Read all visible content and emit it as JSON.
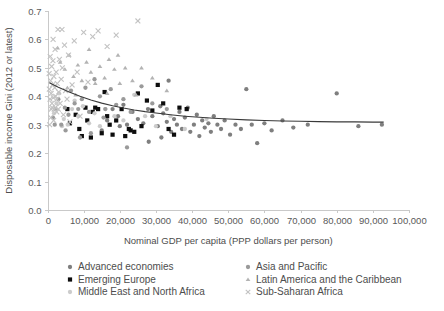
{
  "chart_data": {
    "type": "scatter",
    "title": "",
    "xlabel": "Nominal GDP per capita (PPP dollars per person)",
    "ylabel": "Disposable income Gini (2012 or latest)",
    "xlim": [
      0,
      100000
    ],
    "ylim": [
      0.0,
      0.7
    ],
    "xticks": [
      0,
      10000,
      20000,
      30000,
      40000,
      50000,
      60000,
      70000,
      80000,
      90000,
      100000
    ],
    "xtick_labels": [
      "0",
      "10,000",
      "20,000",
      "30,000",
      "40,000",
      "50,000",
      "60,000",
      "70,000",
      "80,000",
      "90,000",
      "100,000"
    ],
    "yticks": [
      0.0,
      0.1,
      0.2,
      0.3,
      0.4,
      0.5,
      0.6,
      0.7
    ],
    "ytick_labels": [
      "0.0",
      "0.1",
      "0.2",
      "0.3",
      "0.4",
      "0.5",
      "0.6",
      "0.7"
    ],
    "grid": false,
    "legend_position": "bottom",
    "series": [
      {
        "name": "Advanced economies",
        "marker": "circle",
        "color": "#7f7f7f",
        "size": 3.1,
        "points": [
          [
            23500,
            0.345
          ],
          [
            25000,
            0.32
          ],
          [
            26500,
            0.305
          ],
          [
            27800,
            0.355
          ],
          [
            29000,
            0.33
          ],
          [
            30500,
            0.295
          ],
          [
            31200,
            0.365
          ],
          [
            32000,
            0.34
          ],
          [
            33000,
            0.31
          ],
          [
            34200,
            0.275
          ],
          [
            35000,
            0.32
          ],
          [
            35800,
            0.3
          ],
          [
            36500,
            0.345
          ],
          [
            37200,
            0.285
          ],
          [
            38000,
            0.325
          ],
          [
            38800,
            0.36
          ],
          [
            39500,
            0.275
          ],
          [
            40500,
            0.3
          ],
          [
            41300,
            0.335
          ],
          [
            42000,
            0.26
          ],
          [
            42800,
            0.315
          ],
          [
            43500,
            0.29
          ],
          [
            44500,
            0.305
          ],
          [
            45200,
            0.275
          ],
          [
            46000,
            0.33
          ],
          [
            47000,
            0.3
          ],
          [
            48000,
            0.285
          ],
          [
            49000,
            0.315
          ],
          [
            50500,
            0.265
          ],
          [
            52000,
            0.3
          ],
          [
            53500,
            0.285
          ],
          [
            55000,
            0.425
          ],
          [
            56500,
            0.3
          ],
          [
            58000,
            0.235
          ],
          [
            60000,
            0.305
          ],
          [
            62000,
            0.28
          ],
          [
            65000,
            0.315
          ],
          [
            68000,
            0.29
          ],
          [
            72000,
            0.3
          ],
          [
            80000,
            0.41
          ],
          [
            86000,
            0.295
          ],
          [
            92500,
            0.3
          ],
          [
            21000,
            0.37
          ],
          [
            22000,
            0.3
          ],
          [
            19500,
            0.33
          ],
          [
            18000,
            0.355
          ],
          [
            16500,
            0.315
          ],
          [
            15000,
            0.28
          ],
          [
            28000,
            0.24
          ],
          [
            31500,
            0.255
          ],
          [
            33500,
            0.455
          ],
          [
            20000,
            0.295
          ]
        ]
      },
      {
        "name": "Emerging Europe",
        "marker": "square",
        "color": "#0d0d0d",
        "size": 4.2,
        "points": [
          [
            5500,
            0.355
          ],
          [
            6200,
            0.305
          ],
          [
            7800,
            0.335
          ],
          [
            8800,
            0.285
          ],
          [
            9500,
            0.26
          ],
          [
            11000,
            0.315
          ],
          [
            12500,
            0.345
          ],
          [
            13200,
            0.36
          ],
          [
            14000,
            0.355
          ],
          [
            15000,
            0.27
          ],
          [
            15800,
            0.415
          ],
          [
            16500,
            0.33
          ],
          [
            17200,
            0.3
          ],
          [
            18000,
            0.265
          ],
          [
            19000,
            0.315
          ],
          [
            20500,
            0.355
          ],
          [
            21500,
            0.26
          ],
          [
            22500,
            0.285
          ],
          [
            23000,
            0.28
          ],
          [
            24000,
            0.275
          ],
          [
            25000,
            0.41
          ],
          [
            26000,
            0.295
          ],
          [
            27500,
            0.385
          ],
          [
            29000,
            0.35
          ],
          [
            30500,
            0.44
          ],
          [
            32000,
            0.375
          ],
          [
            33500,
            0.285
          ],
          [
            35000,
            0.265
          ],
          [
            36500,
            0.36
          ],
          [
            38500,
            0.355
          ],
          [
            10500,
            0.36
          ],
          [
            12000,
            0.255
          ]
        ]
      },
      {
        "name": "Middle East and North Africa",
        "marker": "circle",
        "color": "#cccccc",
        "size": 3.1,
        "points": [
          [
            1800,
            0.34
          ],
          [
            3200,
            0.41
          ],
          [
            4500,
            0.32
          ],
          [
            5600,
            0.3
          ],
          [
            6800,
            0.355
          ],
          [
            7500,
            0.385
          ],
          [
            8500,
            0.33
          ],
          [
            9800,
            0.365
          ],
          [
            11500,
            0.305
          ],
          [
            13000,
            0.34
          ],
          [
            14500,
            0.295
          ],
          [
            16000,
            0.355
          ],
          [
            18500,
            0.33
          ],
          [
            21000,
            0.315
          ],
          [
            24000,
            0.405
          ],
          [
            27000,
            0.33
          ],
          [
            30000,
            0.295
          ],
          [
            34000,
            0.33
          ],
          [
            38000,
            0.285
          ],
          [
            44000,
            0.32
          ],
          [
            2500,
            0.375
          ],
          [
            4000,
            0.295
          ]
        ]
      },
      {
        "name": "Asia and Pacific",
        "marker": "circle",
        "color": "#9a9a9a",
        "size": 3.1,
        "points": [
          [
            1500,
            0.325
          ],
          [
            2200,
            0.355
          ],
          [
            3000,
            0.39
          ],
          [
            3800,
            0.3
          ],
          [
            4800,
            0.36
          ],
          [
            5800,
            0.335
          ],
          [
            6500,
            0.42
          ],
          [
            7500,
            0.375
          ],
          [
            8500,
            0.355
          ],
          [
            9500,
            0.39
          ],
          [
            10500,
            0.43
          ],
          [
            11500,
            0.345
          ],
          [
            13000,
            0.46
          ],
          [
            14500,
            0.4
          ],
          [
            16000,
            0.355
          ],
          [
            17500,
            0.425
          ],
          [
            19000,
            0.37
          ],
          [
            21000,
            0.39
          ],
          [
            23000,
            0.345
          ],
          [
            26000,
            0.435
          ],
          [
            29000,
            0.375
          ],
          [
            33000,
            0.355
          ],
          [
            2000,
            0.3
          ],
          [
            5000,
            0.28
          ],
          [
            9000,
            0.255
          ],
          [
            12000,
            0.27
          ],
          [
            15500,
            0.325
          ],
          [
            22000,
            0.22
          ]
        ]
      },
      {
        "name": "Latin America and the Caribbean",
        "marker": "triangle",
        "color": "#b3b3b3",
        "size": 3.6,
        "points": [
          [
            3500,
            0.52
          ],
          [
            4800,
            0.495
          ],
          [
            6000,
            0.545
          ],
          [
            7200,
            0.47
          ],
          [
            8400,
            0.51
          ],
          [
            9500,
            0.455
          ],
          [
            10800,
            0.52
          ],
          [
            12000,
            0.485
          ],
          [
            13200,
            0.445
          ],
          [
            14500,
            0.505
          ],
          [
            15800,
            0.465
          ],
          [
            17000,
            0.53
          ],
          [
            18500,
            0.495
          ],
          [
            20000,
            0.445
          ],
          [
            21500,
            0.5
          ],
          [
            23500,
            0.455
          ],
          [
            26000,
            0.5
          ],
          [
            29000,
            0.465
          ],
          [
            33000,
            0.42
          ],
          [
            2800,
            0.57
          ],
          [
            11500,
            0.565
          ],
          [
            16500,
            0.41
          ],
          [
            19500,
            0.545
          ],
          [
            5500,
            0.43
          ],
          [
            7800,
            0.405
          ],
          [
            24500,
            0.405
          ]
        ]
      },
      {
        "name": "Sub-Saharan Africa",
        "marker": "x",
        "color": "#c2c2c2",
        "size": 3.4,
        "points": [
          [
            500,
            0.425
          ],
          [
            700,
            0.39
          ],
          [
            850,
            0.455
          ],
          [
            1000,
            0.41
          ],
          [
            1150,
            0.505
          ],
          [
            1250,
            0.375
          ],
          [
            1400,
            0.44
          ],
          [
            1500,
            0.525
          ],
          [
            1600,
            0.395
          ],
          [
            1750,
            0.47
          ],
          [
            1850,
            0.355
          ],
          [
            2000,
            0.43
          ],
          [
            2100,
            0.565
          ],
          [
            2250,
            0.4
          ],
          [
            2400,
            0.485
          ],
          [
            2550,
            0.345
          ],
          [
            2700,
            0.445
          ],
          [
            2900,
            0.635
          ],
          [
            3100,
            0.415
          ],
          [
            3300,
            0.53
          ],
          [
            3500,
            0.375
          ],
          [
            3800,
            0.46
          ],
          [
            4100,
            0.5
          ],
          [
            4400,
            0.335
          ],
          [
            4700,
            0.58
          ],
          [
            5000,
            0.42
          ],
          [
            5400,
            0.39
          ],
          [
            5800,
            0.545
          ],
          [
            6200,
            0.31
          ],
          [
            6800,
            0.44
          ],
          [
            7400,
            0.595
          ],
          [
            8200,
            0.485
          ],
          [
            9000,
            0.33
          ],
          [
            10000,
            0.625
          ],
          [
            11200,
            0.45
          ],
          [
            12500,
            0.61
          ],
          [
            14000,
            0.63
          ],
          [
            16500,
            0.575
          ],
          [
            19000,
            0.615
          ],
          [
            25000,
            0.665
          ],
          [
            600,
            0.3
          ],
          [
            900,
            0.325
          ],
          [
            1300,
            0.36
          ],
          [
            1700,
            0.315
          ],
          [
            2200,
            0.36
          ],
          [
            3000,
            0.355
          ],
          [
            450,
            0.48
          ],
          [
            750,
            0.54
          ],
          [
            1050,
            0.355
          ],
          [
            1550,
            0.6
          ],
          [
            2600,
            0.39
          ],
          [
            4000,
            0.635
          ]
        ]
      }
    ],
    "trendline": {
      "name": "fitted-trend",
      "color": "#3a3a3a",
      "points": [
        [
          500,
          0.448
        ],
        [
          3000,
          0.432
        ],
        [
          6000,
          0.415
        ],
        [
          9000,
          0.4
        ],
        [
          12000,
          0.387
        ],
        [
          15000,
          0.376
        ],
        [
          18000,
          0.367
        ],
        [
          21000,
          0.359
        ],
        [
          24000,
          0.352
        ],
        [
          27000,
          0.346
        ],
        [
          30000,
          0.341
        ],
        [
          34000,
          0.335
        ],
        [
          38000,
          0.33
        ],
        [
          42000,
          0.326
        ],
        [
          46000,
          0.323
        ],
        [
          50000,
          0.32
        ],
        [
          55000,
          0.317
        ],
        [
          60000,
          0.315
        ],
        [
          65000,
          0.313
        ],
        [
          70000,
          0.312
        ],
        [
          75000,
          0.311
        ],
        [
          80000,
          0.31
        ],
        [
          85000,
          0.31
        ],
        [
          90000,
          0.309
        ],
        [
          93000,
          0.309
        ]
      ]
    },
    "legend_entries": [
      {
        "label": "Advanced economies",
        "marker": "circle",
        "color": "#7f7f7f"
      },
      {
        "label": "Emerging Europe",
        "marker": "square",
        "color": "#0d0d0d"
      },
      {
        "label": "Middle East and North Africa",
        "marker": "circle",
        "color": "#cccccc"
      },
      {
        "label": "Asia and Pacific",
        "marker": "circle",
        "color": "#9a9a9a"
      },
      {
        "label": "Latin America and the Caribbean",
        "marker": "triangle",
        "color": "#b3b3b3"
      },
      {
        "label": "Sub-Saharan Africa",
        "marker": "x",
        "color": "#c2c2c2"
      }
    ]
  },
  "axes": {
    "x_title": "Nominal GDP per capita (PPP dollars per person)",
    "y_title": "Disposable income Gini (2012 or latest)"
  }
}
